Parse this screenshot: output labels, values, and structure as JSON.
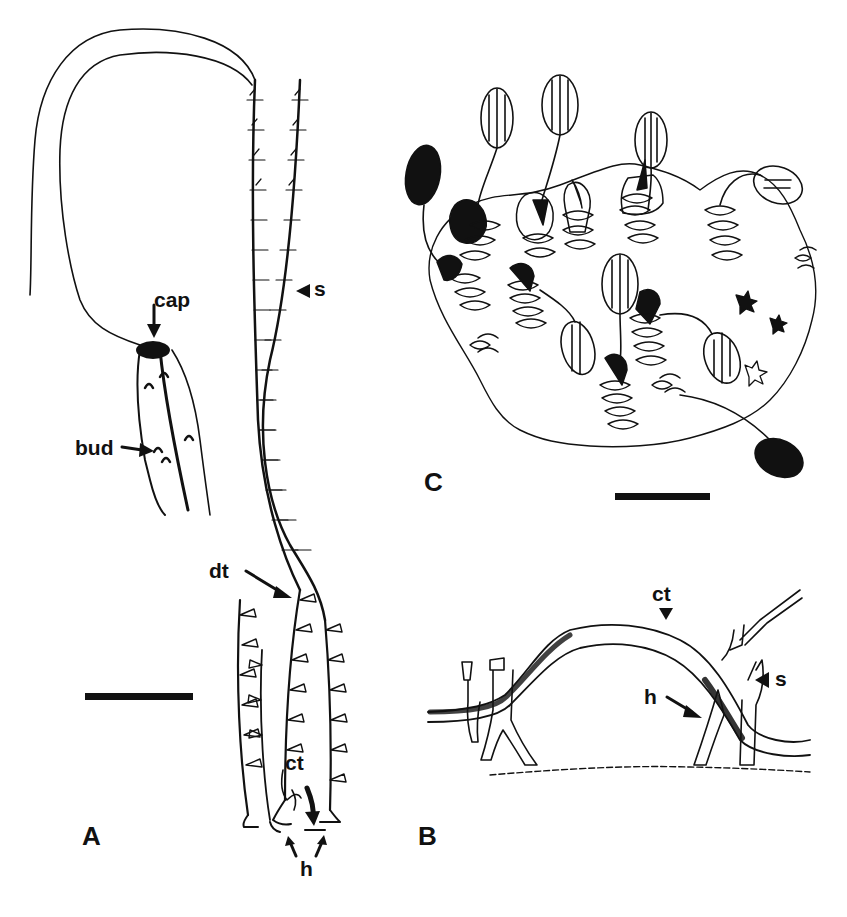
{
  "figure": {
    "panels": [
      {
        "id": "A",
        "label": "A",
        "annotations": {
          "cap": "cap",
          "bud": "bud",
          "s": "s",
          "dt": "dt",
          "ct": "ct",
          "h": "h"
        },
        "scale_bar": true
      },
      {
        "id": "B",
        "label": "B",
        "annotations": {
          "ct": "ct",
          "s": "s",
          "h": "h"
        }
      },
      {
        "id": "C",
        "label": "C",
        "scale_bar": true
      }
    ],
    "colors": {
      "ink": "#111111",
      "background": "#ffffff"
    }
  }
}
